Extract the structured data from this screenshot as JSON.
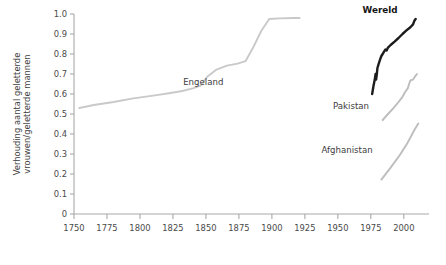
{
  "chart_data": {
    "type": "line",
    "title": "",
    "xlabel": "",
    "ylabel": "Verhouding aantal geletterde vrouwen/geletterde mannen",
    "ylabel_line1": "Verhouding aantal geletterde",
    "ylabel_line2": "vrouwen/geletterde mannen",
    "xlim": [
      1750,
      2010
    ],
    "ylim": [
      0,
      1.0
    ],
    "grid": false,
    "legend_position": "inline-annotations",
    "xticks": [
      1750,
      1775,
      1800,
      1825,
      1850,
      1875,
      1900,
      1925,
      1950,
      1975,
      2000
    ],
    "xtick_labels": [
      "1750",
      "1775",
      "1800",
      "1825",
      "1850",
      "1875",
      "1900",
      "1925",
      "1950",
      "1975",
      "2000"
    ],
    "yticks": [
      0,
      0.1,
      0.2,
      0.3,
      0.4,
      0.5,
      0.6,
      0.7,
      0.8,
      0.9,
      1.0
    ],
    "ytick_labels": [
      "0",
      "0.1",
      "0.2",
      "0.3",
      "0.4",
      "0.5",
      "0.6",
      "0.7",
      "0.8",
      "0.9",
      "1.0"
    ],
    "series": [
      {
        "name": "Engeland",
        "color": "#c9c9c9",
        "width": 1.9,
        "label_x": 1848,
        "label_y": 0.645,
        "bold": false,
        "points": [
          [
            1754,
            0.53
          ],
          [
            1765,
            0.545
          ],
          [
            1780,
            0.56
          ],
          [
            1795,
            0.578
          ],
          [
            1810,
            0.592
          ],
          [
            1822,
            0.604
          ],
          [
            1832,
            0.615
          ],
          [
            1840,
            0.628
          ],
          [
            1846,
            0.642
          ],
          [
            1851,
            0.686
          ],
          [
            1858,
            0.722
          ],
          [
            1866,
            0.742
          ],
          [
            1874,
            0.752
          ],
          [
            1880,
            0.764
          ],
          [
            1886,
            0.835
          ],
          [
            1892,
            0.916
          ],
          [
            1898,
            0.975
          ],
          [
            1906,
            0.978
          ],
          [
            1916,
            0.98
          ],
          [
            1921,
            0.98
          ]
        ]
      },
      {
        "name": "Wereld",
        "color": "#1c1c1c",
        "width": 2.4,
        "label_x": 1982,
        "label_y": 1.005,
        "bold": true,
        "points": [
          [
            1976,
            0.6
          ],
          [
            1977,
            0.64
          ],
          [
            1978,
            0.672
          ],
          [
            1978.6,
            0.7
          ],
          [
            1979,
            0.672
          ],
          [
            1979.6,
            0.702
          ],
          [
            1980,
            0.73
          ],
          [
            1981,
            0.752
          ],
          [
            1982,
            0.772
          ],
          [
            1983,
            0.79
          ],
          [
            1984,
            0.8
          ],
          [
            1985,
            0.812
          ],
          [
            1986,
            0.822
          ],
          [
            1987,
            0.818
          ],
          [
            1988,
            0.832
          ],
          [
            1990,
            0.845
          ],
          [
            1993,
            0.862
          ],
          [
            1996,
            0.88
          ],
          [
            1999,
            0.9
          ],
          [
            2002,
            0.918
          ],
          [
            2005,
            0.934
          ],
          [
            2007,
            0.948
          ],
          [
            2008,
            0.966
          ],
          [
            2009,
            0.975
          ]
        ]
      },
      {
        "name": "Pakistan",
        "color": "#bdbdbd",
        "width": 1.9,
        "label_x": 1960,
        "label_y": 0.525,
        "bold": false,
        "points": [
          [
            1984,
            0.47
          ],
          [
            1988,
            0.5
          ],
          [
            1992,
            0.528
          ],
          [
            1996,
            0.56
          ],
          [
            1999,
            0.586
          ],
          [
            2001,
            0.61
          ],
          [
            2003,
            0.628
          ],
          [
            2004,
            0.65
          ],
          [
            2005,
            0.668
          ],
          [
            2007,
            0.672
          ],
          [
            2009,
            0.692
          ],
          [
            2010,
            0.7
          ]
        ]
      },
      {
        "name": "Afghanistan",
        "color": "#bdbdbd",
        "width": 1.9,
        "label_x": 1957,
        "label_y": 0.305,
        "bold": false,
        "points": [
          [
            1983,
            0.172
          ],
          [
            1990,
            0.232
          ],
          [
            1997,
            0.295
          ],
          [
            2003,
            0.358
          ],
          [
            2008,
            0.42
          ],
          [
            2011,
            0.452
          ]
        ]
      }
    ]
  }
}
